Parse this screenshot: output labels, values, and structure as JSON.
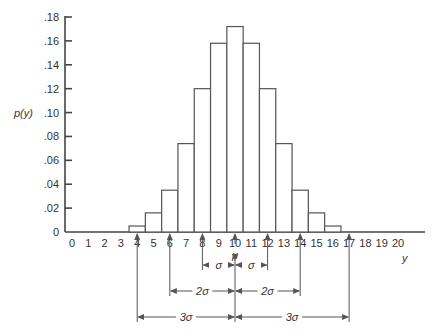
{
  "chart_data": {
    "type": "bar",
    "title": "",
    "xlabel": "y",
    "ylabel": "p(y)",
    "categories": [
      4,
      5,
      6,
      7,
      8,
      9,
      10,
      11,
      12,
      13,
      14,
      15,
      16
    ],
    "values": [
      0.005,
      0.016,
      0.035,
      0.074,
      0.12,
      0.158,
      0.172,
      0.158,
      0.12,
      0.074,
      0.035,
      0.016,
      0.005
    ],
    "x_ticks": [
      "0",
      "1",
      "2",
      "3",
      "4",
      "5",
      "6",
      "7",
      "8",
      "9",
      "10",
      "11",
      "12",
      "13",
      "14",
      "15",
      "16",
      "17",
      "18",
      "19",
      "20"
    ],
    "y_ticks": [
      "0",
      ".02",
      ".04",
      ".06",
      ".08",
      ".10",
      ".12",
      ".14",
      ".16",
      ".18"
    ],
    "ylim": [
      0,
      0.18
    ],
    "xlim": [
      0,
      20
    ],
    "grid": false,
    "legend": null,
    "annotations": {
      "mean_label": "μ",
      "mean_x": 10,
      "intervals": [
        {
          "label_left": "σ",
          "label_right": "σ",
          "from": 8,
          "to": 12
        },
        {
          "label_left": "2σ",
          "label_right": "2σ",
          "from": 6,
          "to": 14
        },
        {
          "label_left": "3σ",
          "label_right": "3σ",
          "from": 4,
          "to": 17
        }
      ]
    }
  }
}
